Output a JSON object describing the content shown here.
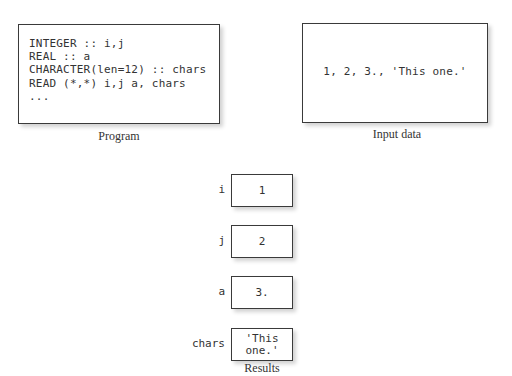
{
  "program": {
    "caption": "Program",
    "code": "INTEGER :: i,j\nREAL :: a\nCHARACTER(len=12) :: chars\nREAD (*,*) i,j a, chars\n..."
  },
  "input_data": {
    "caption": "Input data",
    "text": "1, 2, 3., 'This one.'"
  },
  "results": {
    "caption": "Results",
    "variables": [
      {
        "name": "i",
        "value": "1"
      },
      {
        "name": "j",
        "value": "2"
      },
      {
        "name": "a",
        "value": "3."
      },
      {
        "name": "chars",
        "value": "'This\none.'"
      }
    ]
  }
}
